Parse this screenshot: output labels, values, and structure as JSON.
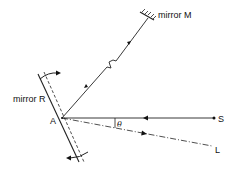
{
  "diagram": {
    "type": "optics-schematic",
    "labels": {
      "mirror_m": "mirror  M",
      "mirror_r": "mirror  R",
      "point_a": "A",
      "source_s": "S",
      "output_l": "L",
      "angle": "θ"
    },
    "colors": {
      "line": "#222222",
      "background": "#ffffff"
    },
    "elements": [
      {
        "id": "source-S",
        "kind": "point-source",
        "label": "S"
      },
      {
        "id": "beam-S-A",
        "kind": "beam",
        "from": "S",
        "to": "A",
        "style": "solid"
      },
      {
        "id": "beam-A-M",
        "kind": "beam",
        "from": "A",
        "to": "mirror M",
        "style": "solid",
        "note": "break (zigzag) indicates long distance"
      },
      {
        "id": "beam-A-L",
        "kind": "beam",
        "from": "A",
        "to": "L",
        "style": "dash-dot"
      },
      {
        "id": "mirror-R",
        "kind": "rotating-mirror",
        "label": "mirror R",
        "note": "dashed line shows rotated position"
      },
      {
        "id": "mirror-M",
        "kind": "fixed-mirror",
        "label": "mirror M"
      },
      {
        "id": "angle-theta",
        "kind": "angle",
        "label": "θ",
        "between": [
          "A-S",
          "A-L"
        ]
      }
    ]
  }
}
